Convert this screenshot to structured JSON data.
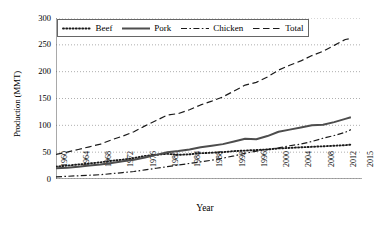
{
  "chart_data": {
    "type": "line",
    "title": "",
    "xlabel": "Year",
    "ylabel": "Production (MMT)",
    "xlim": [
      1960,
      2015
    ],
    "ylim": [
      0,
      300
    ],
    "yticks": [
      0,
      50,
      100,
      150,
      200,
      250,
      300
    ],
    "xticks": [
      1960,
      1964,
      1968,
      1972,
      1976,
      1980,
      1984,
      1988,
      1992,
      1996,
      2000,
      2004,
      2008,
      2012,
      2015
    ],
    "grid": "horizontal-dotted",
    "legend_position": "top-inside",
    "x": [
      1960,
      1962,
      1964,
      1966,
      1968,
      1970,
      1972,
      1974,
      1976,
      1978,
      1980,
      1982,
      1984,
      1986,
      1988,
      1990,
      1992,
      1994,
      1996,
      1998,
      2000,
      2002,
      2004,
      2006,
      2008,
      2010,
      2012,
      2013
    ],
    "series": [
      {
        "name": "Beef",
        "style": "dotted",
        "values": [
          23,
          25,
          27,
          29,
          31,
          34,
          36,
          39,
          43,
          45,
          47,
          45,
          46,
          48,
          49,
          50,
          52,
          53,
          54,
          55,
          57,
          58,
          59,
          60,
          61,
          62,
          63,
          64
        ]
      },
      {
        "name": "Pork",
        "style": "solid",
        "values": [
          20,
          21,
          23,
          25,
          27,
          30,
          33,
          36,
          40,
          45,
          50,
          52,
          55,
          59,
          62,
          65,
          70,
          75,
          74,
          80,
          88,
          92,
          96,
          100,
          101,
          106,
          112,
          115
        ]
      },
      {
        "name": "Chicken",
        "style": "dash-dot",
        "values": [
          4,
          5,
          6,
          7,
          8,
          10,
          12,
          14,
          17,
          20,
          23,
          26,
          29,
          32,
          35,
          39,
          43,
          48,
          52,
          55,
          58,
          62,
          65,
          70,
          76,
          81,
          87,
          92
        ]
      },
      {
        "name": "Total",
        "style": "dashed",
        "values": [
          46,
          50,
          55,
          60,
          65,
          73,
          80,
          88,
          99,
          109,
          119,
          122,
          129,
          138,
          145,
          153,
          164,
          175,
          180,
          190,
          203,
          212,
          220,
          230,
          238,
          249,
          260,
          262
        ]
      }
    ]
  }
}
